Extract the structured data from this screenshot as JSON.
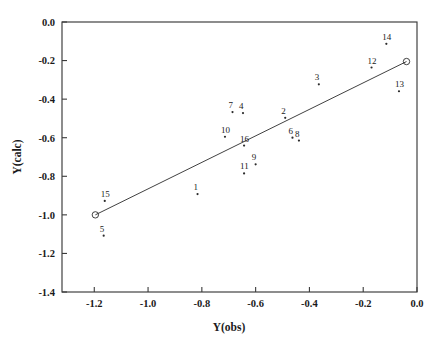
{
  "chart_data": {
    "type": "scatter",
    "title": "",
    "xlabel": "Y(obs)",
    "ylabel": "Y(calc)",
    "xlim": [
      -1.32,
      0.0
    ],
    "ylim": [
      -1.4,
      0.0
    ],
    "grid": false,
    "legend": "none",
    "xticks": [
      "-1.2",
      "-1.0",
      "-0.8",
      "-0.6",
      "-0.4",
      "-0.2",
      "0.0"
    ],
    "xtick_values": [
      -1.2,
      -1.0,
      -0.8,
      -0.6,
      -0.4,
      -0.2,
      0.0
    ],
    "yticks": [
      "0.0",
      "-0.2",
      "-0.4",
      "-0.6",
      "-0.8",
      "-1.0",
      "-1.2",
      "-1.4"
    ],
    "ytick_values": [
      0.0,
      -0.2,
      -0.4,
      -0.6,
      -0.8,
      -1.0,
      -1.2,
      -1.4
    ],
    "marker_style": "small-dot",
    "label_offset": {
      "dx": -4,
      "dy": -4
    },
    "points": [
      {
        "label": "1",
        "x": -0.816,
        "y": -0.892
      },
      {
        "label": "2",
        "x": -0.49,
        "y": -0.497
      },
      {
        "label": "3",
        "x": -0.365,
        "y": -0.323
      },
      {
        "label": "4",
        "x": -0.647,
        "y": -0.472
      },
      {
        "label": "5",
        "x": -1.165,
        "y": -1.108
      },
      {
        "label": "6",
        "x": -0.463,
        "y": -0.6
      },
      {
        "label": "7",
        "x": -0.686,
        "y": -0.467
      },
      {
        "label": "8",
        "x": -0.439,
        "y": -0.615
      },
      {
        "label": "9",
        "x": -0.6,
        "y": -0.738
      },
      {
        "label": "10",
        "x": -0.714,
        "y": -0.595
      },
      {
        "label": "11",
        "x": -0.643,
        "y": -0.785
      },
      {
        "label": "12",
        "x": -0.169,
        "y": -0.236
      },
      {
        "label": "13",
        "x": -0.067,
        "y": -0.359
      },
      {
        "label": "14",
        "x": -0.114,
        "y": -0.113
      },
      {
        "label": "15",
        "x": -1.161,
        "y": -0.928
      },
      {
        "label": "16",
        "x": -0.643,
        "y": -0.641
      }
    ],
    "fit_line": {
      "description": "diagonal reference line with open-circle endpoints",
      "endpoints": [
        {
          "x": -1.196,
          "y": -1.0,
          "marker": "open-circle"
        },
        {
          "x": -0.039,
          "y": -0.205,
          "marker": "open-circle"
        }
      ]
    }
  },
  "axes": {
    "xlabel": "Y(obs)",
    "ylabel": "Y(calc)"
  }
}
